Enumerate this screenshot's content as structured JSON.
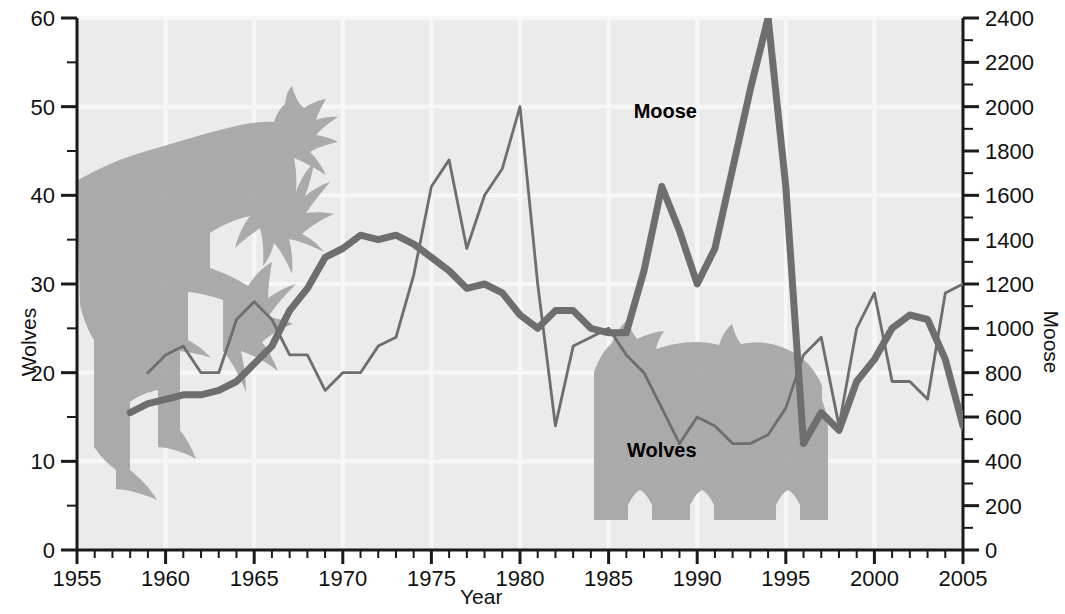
{
  "chart_data": {
    "type": "line",
    "title": "",
    "xlabel": "Year",
    "ylabel_left": "Wolves",
    "ylabel_right": "Moose",
    "xlim": [
      1955,
      2005
    ],
    "ylim_left": [
      0,
      60
    ],
    "ylim_right": [
      0,
      2400
    ],
    "xticks": [
      1955,
      1960,
      1965,
      1970,
      1975,
      1980,
      1985,
      1990,
      1995,
      2000,
      2005
    ],
    "xtick_labels": [
      "1955",
      "1960",
      "1965",
      "1970",
      "1975",
      "1980",
      "1985",
      "1990",
      "1995",
      "2000",
      "2005"
    ],
    "xminor_step": 1,
    "yticks_left": [
      0,
      10,
      20,
      30,
      40,
      50,
      60
    ],
    "ytick_labels_left": [
      "0",
      "10",
      "20",
      "30",
      "40",
      "50",
      "60"
    ],
    "yminor_step_left": 5,
    "yticks_right": [
      0,
      200,
      400,
      600,
      800,
      1000,
      1200,
      1400,
      1600,
      1800,
      2000,
      2200,
      2400
    ],
    "ytick_labels_right": [
      "0",
      "200",
      "400",
      "600",
      "800",
      "1000",
      "1200",
      "1400",
      "1600",
      "1800",
      "2000",
      "2200",
      "2400"
    ],
    "yminor_step_right": 100,
    "grid": true,
    "legend_position": "inline-annotations",
    "annotations": [
      {
        "text": "Moose",
        "x": 1988.2,
        "y_right": 1950
      },
      {
        "text": "Wolves",
        "x": 1988.0,
        "y_left": 10.5
      }
    ],
    "series": [
      {
        "name": "Wolves",
        "axis": "left",
        "units": "wolves",
        "style": "thin-line",
        "color": "#6e6e6e",
        "x": [
          1959,
          1960,
          1961,
          1962,
          1963,
          1964,
          1965,
          1966,
          1967,
          1968,
          1969,
          1970,
          1971,
          1972,
          1973,
          1974,
          1975,
          1976,
          1977,
          1978,
          1979,
          1980,
          1981,
          1982,
          1983,
          1984,
          1985,
          1986,
          1987,
          1988,
          1989,
          1990,
          1991,
          1992,
          1993,
          1994,
          1995,
          1996,
          1997,
          1998,
          1999,
          2000,
          2001,
          2002,
          2003,
          2004,
          2005
        ],
        "values": [
          20,
          22,
          23,
          20,
          20,
          26,
          28,
          26,
          22,
          22,
          18,
          20,
          20,
          23,
          24,
          31,
          41,
          44,
          34,
          40,
          43,
          50,
          30,
          14,
          23,
          24,
          25,
          22,
          20,
          16,
          12,
          15,
          14,
          12,
          12,
          13,
          16,
          22,
          24,
          14,
          25,
          29,
          19,
          19,
          17,
          29,
          30
        ]
      },
      {
        "name": "Moose",
        "axis": "right",
        "units": "moose",
        "style": "thick-line",
        "color": "#6e6e6e",
        "x": [
          1958,
          1959,
          1960,
          1961,
          1962,
          1963,
          1964,
          1965,
          1966,
          1967,
          1968,
          1969,
          1970,
          1971,
          1972,
          1973,
          1974,
          1975,
          1976,
          1977,
          1978,
          1979,
          1980,
          1981,
          1982,
          1983,
          1984,
          1985,
          1986,
          1987,
          1988,
          1989,
          1990,
          1991,
          1992,
          1993,
          1994,
          1995,
          1996,
          1997,
          1998,
          1999,
          2000,
          2001,
          2002,
          2003,
          2004,
          2005
        ],
        "values": [
          620,
          660,
          680,
          700,
          700,
          720,
          760,
          840,
          920,
          1080,
          1180,
          1320,
          1360,
          1420,
          1400,
          1420,
          1380,
          1320,
          1260,
          1180,
          1200,
          1160,
          1060,
          1000,
          1080,
          1080,
          1000,
          980,
          980,
          1260,
          1640,
          1440,
          1200,
          1360,
          1720,
          2080,
          2400,
          1640,
          480,
          620,
          540,
          760,
          860,
          1000,
          1060,
          1040,
          860,
          560
        ]
      }
    ]
  },
  "decor": {
    "moose_silhouette_color": "#a6a6a6",
    "wolf_silhouette_color": "#a6a6a6",
    "plot_background_color": "#ebebeb",
    "grid_color": "#f7f7f7",
    "axis_color": "#1a1a1a",
    "line_color": "#6e6e6e"
  }
}
